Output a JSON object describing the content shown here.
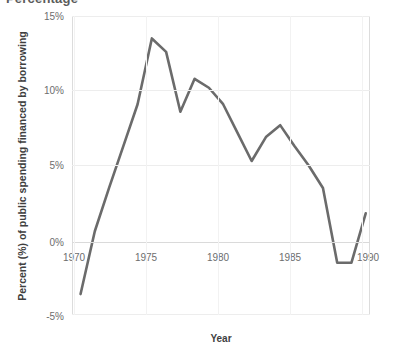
{
  "figure": {
    "cropped_title_fragment": "Percentage",
    "line_color": "#6b6b6b",
    "grid_color": "#ededed",
    "zero_line_color": "#dadada",
    "border_color": "#dcdcdc",
    "tick_text_color": "#6d6d6d",
    "axis_title_color": "#3f3f3f"
  },
  "chart_data": {
    "type": "line",
    "title": "",
    "xlabel": "Year",
    "ylabel": "Percent (%) of public spending financed by borrowing",
    "xlim": [
      1969.4,
      1990.3
    ],
    "ylim": [
      -5,
      15
    ],
    "grid": true,
    "legend": "none",
    "ytick_labels": [
      "15%",
      "10%",
      "5%",
      "0%",
      "-5%"
    ],
    "ytick_values": [
      15,
      10,
      5,
      0,
      -5
    ],
    "xtick_labels": [
      "1970",
      "1975",
      "1980",
      "1985",
      "1990"
    ],
    "xtick_values": [
      1970,
      1975,
      1980,
      1985,
      1990
    ],
    "x": [
      1970,
      1971,
      1972,
      1973,
      1974,
      1975,
      1976,
      1977,
      1978,
      1979,
      1980,
      1981,
      1982,
      1983,
      1984,
      1985,
      1986,
      1987,
      1988,
      1989,
      1990
    ],
    "series": [
      {
        "name": "Percent of public spending financed by borrowing",
        "values": [
          -3.6,
          0.6,
          3.5,
          6.3,
          9.1,
          13.5,
          12.6,
          8.6,
          10.8,
          10.2,
          9.1,
          7.2,
          5.3,
          6.9,
          7.7,
          6.3,
          5.0,
          3.5,
          -1.5,
          -1.5,
          1.8
        ]
      }
    ]
  }
}
